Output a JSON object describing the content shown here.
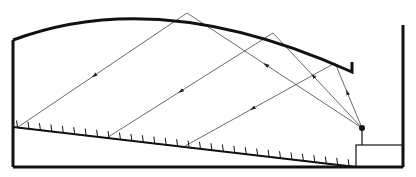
{
  "diagram": {
    "colors": {
      "background": "#ffffff",
      "structure": "#111111",
      "ray": "#444444"
    },
    "structure": {
      "left_wall": {
        "x": 13,
        "y1": 40,
        "y2": 167
      },
      "right_wall": {
        "x": 403,
        "y1": 25,
        "y2": 167
      },
      "bottom": {
        "x1": 13,
        "x2": 403,
        "y": 167
      },
      "ceiling": {
        "start": [
          13,
          40
        ],
        "control": [
          160,
          -15
        ],
        "end": [
          352,
          72
        ],
        "lip": [
          352,
          62
        ]
      },
      "stage_box": {
        "x": 356,
        "y": 145,
        "w": 47,
        "h": 22
      },
      "seating_floor": {
        "start": [
          13,
          127
        ],
        "end": [
          356,
          167
        ],
        "ticks": 30
      }
    },
    "source": {
      "point": [
        362,
        128
      ],
      "stand_to_y": 145,
      "label": "sound-source"
    },
    "reflection_points": [
      [
        187,
        13
      ],
      [
        273,
        33
      ],
      [
        335,
        63
      ]
    ],
    "floor_hits": [
      [
        18,
        127
      ],
      [
        105,
        139
      ],
      [
        185,
        146
      ]
    ]
  }
}
